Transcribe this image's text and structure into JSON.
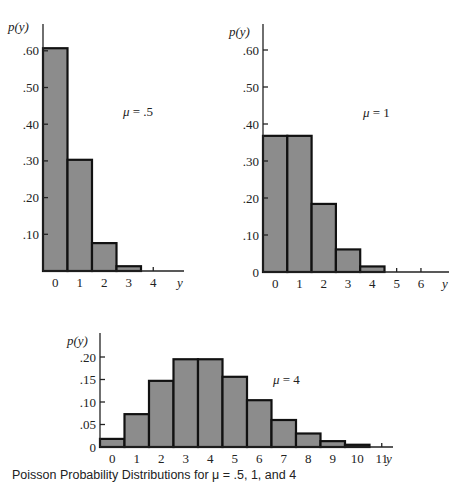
{
  "caption": "Poisson Probability Distributions for μ = .5, 1, and 4",
  "chart_data": [
    {
      "type": "bar",
      "title": "μ = .5",
      "annotation": "μ = .5",
      "xlabel": "y",
      "ylabel": "p(y)",
      "categories": [
        "0",
        "1",
        "2",
        "3",
        "4"
      ],
      "values": [
        0.607,
        0.303,
        0.076,
        0.013,
        0.002
      ],
      "yticks": [
        ".10",
        ".20",
        ".30",
        ".40",
        ".50",
        ".60"
      ],
      "ylim": [
        0,
        0.65
      ],
      "grid": false,
      "frame": {
        "x0": 43,
        "x1": 184,
        "y0": 271,
        "ppu": 367,
        "barw": 24.5,
        "yaxis_top": 24,
        "label_x": 30,
        "ytitle_x": 8,
        "ytitle_y": 31,
        "annot_x": 123,
        "annot_y": 116,
        "zero_label": false
      }
    },
    {
      "type": "bar",
      "title": "μ = 1",
      "annotation": "μ = 1",
      "xlabel": "y",
      "ylabel": "p(y)",
      "categories": [
        "0",
        "1",
        "2",
        "3",
        "4",
        "5",
        "6"
      ],
      "values": [
        0.368,
        0.368,
        0.184,
        0.061,
        0.015,
        0.003,
        0.0005
      ],
      "yticks": [
        "0",
        ".10",
        ".20",
        ".30",
        ".40",
        ".50",
        ".60"
      ],
      "ylim": [
        0,
        0.65
      ],
      "grid": false,
      "frame": {
        "x0": 263,
        "x1": 449,
        "y0": 272,
        "ppu": 370,
        "barw": 24.3,
        "yaxis_top": 24,
        "label_x": 251,
        "ytitle_x": 229,
        "ytitle_y": 36,
        "annot_x": 363,
        "annot_y": 117,
        "zero_label": true
      }
    },
    {
      "type": "bar",
      "title": "μ = 4",
      "annotation": "μ = 4",
      "xlabel": "y",
      "ylabel": "p(y)",
      "categories": [
        "0",
        "1",
        "2",
        "3",
        "4",
        "5",
        "6",
        "7",
        "8",
        "9",
        "10",
        "11"
      ],
      "values": [
        0.018,
        0.073,
        0.147,
        0.195,
        0.195,
        0.156,
        0.104,
        0.06,
        0.03,
        0.013,
        0.005,
        0.002
      ],
      "yticks": [
        "0",
        ".05",
        ".10",
        ".15",
        ".20"
      ],
      "ylim": [
        0,
        0.22
      ],
      "grid": false,
      "frame": {
        "x0": 100,
        "x1": 393,
        "y0": 447,
        "ppu": 450,
        "barw": 24.5,
        "yaxis_top": 333,
        "label_x": 90,
        "ytitle_x": 67,
        "ytitle_y": 345,
        "annot_x": 273,
        "annot_y": 384,
        "zero_label": true
      }
    }
  ]
}
